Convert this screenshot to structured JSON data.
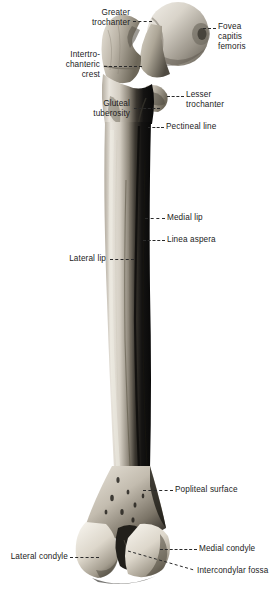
{
  "figure": {
    "width_px": 278,
    "height_px": 599,
    "background_color": "#ffffff",
    "label_color": "#1b1b1b",
    "leader_color": "#2a2a2a"
  },
  "labels": {
    "greater_trochanter": "Greater\ntrochanter",
    "fovea_capitis_femoris": "Fovea\ncapitis\nfemoris",
    "intertrochanteric_crest": "Intertro-\nchanteric\ncrest",
    "lesser_trochanter": "Lesser\ntrochanter",
    "gluteal_tuberosity": "Gluteal\ntuberosity",
    "pectineal_line": "Pectineal line",
    "medial_lip": "Medial lip",
    "linea_aspera": "Linea aspera",
    "lateral_lip": "Lateral lip",
    "popliteal_surface": "Popliteal surface",
    "lateral_condyle": "Lateral condyle",
    "medial_condyle": "Medial condyle",
    "intercondylar_fossa": "Intercondylar fossa"
  }
}
